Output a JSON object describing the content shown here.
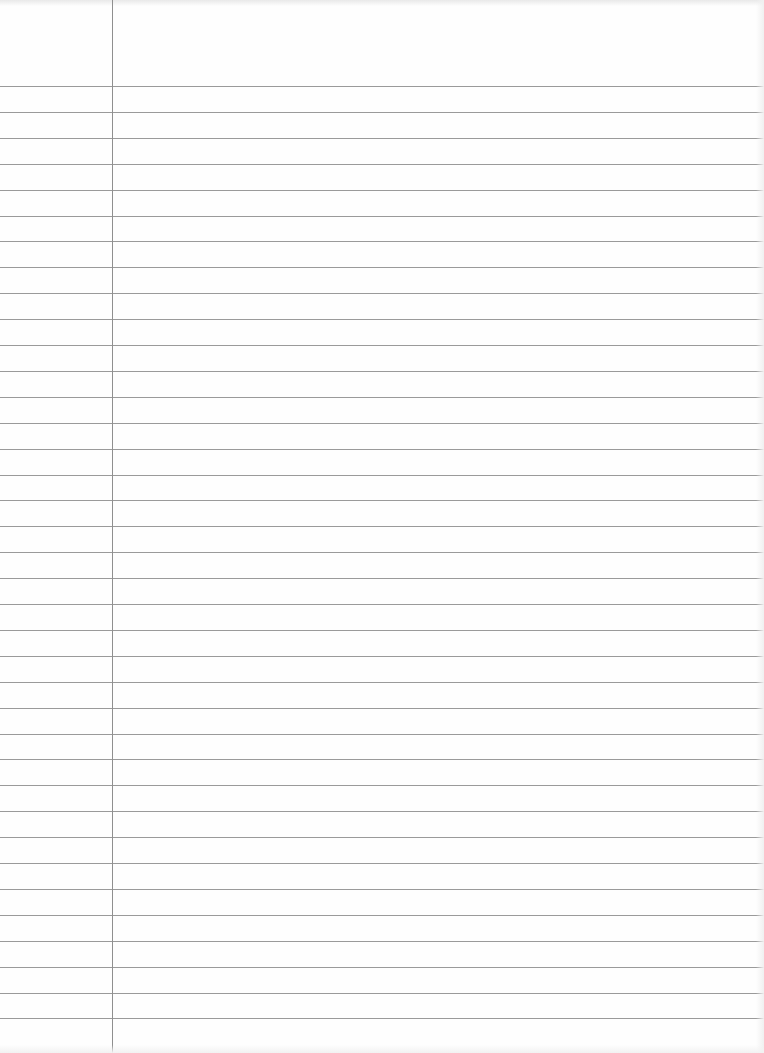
{
  "paper": {
    "type": "lined-notebook-page",
    "background_color": "#fefefe",
    "rule_color": "#9a9a9a",
    "margin_color": "#8f8f8f",
    "margin_x": 112,
    "first_rule_y": 86,
    "rule_spacing": 25.9,
    "rule_count": 37,
    "content": ""
  }
}
